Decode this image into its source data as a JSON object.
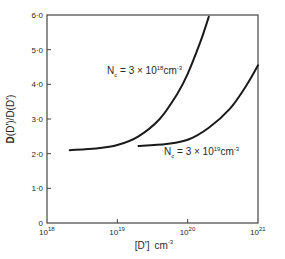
{
  "chart_data": {
    "type": "line",
    "title": "",
    "xlabel": "[D'] cm^-3",
    "xlabel_parts": {
      "main": "[D']",
      "unit": "cm",
      "unit_exp": "-3"
    },
    "ylabel": "D(D')/D(D')",
    "ylabel_parts": {
      "bold": "D",
      "rest": "(D')/D(D')"
    },
    "xscale": "log",
    "xlim": [
      1e+18,
      1e+21
    ],
    "ylim": [
      0,
      6.0
    ],
    "grid": false,
    "legend": "none (curves labeled inline)",
    "x_ticks": [
      {
        "base": "10",
        "exp": "18",
        "value": 1e+18
      },
      {
        "base": "10",
        "exp": "19",
        "value": 1e+19
      },
      {
        "base": "10",
        "exp": "20",
        "value": 1e+20
      },
      {
        "base": "10",
        "exp": "21",
        "value": 1e+21
      }
    ],
    "y_ticks": [
      {
        "label": "0",
        "value": 0
      },
      {
        "label": "1·0",
        "value": 1.0
      },
      {
        "label": "2·0",
        "value": 2.0
      },
      {
        "label": "3·0",
        "value": 3.0
      },
      {
        "label": "4·0",
        "value": 4.0
      },
      {
        "label": "5·0",
        "value": 5.0
      },
      {
        "label": "6·0",
        "value": 6.0
      }
    ],
    "series": [
      {
        "name": "Nc = 3×10^18 cm^-3",
        "label_parts": {
          "pre": "N",
          "sub": "c",
          "mid": " = 3 × 10",
          "exp": "18",
          "unit": "cm",
          "unit_exp": "-3"
        },
        "x": [
          2.1e+18,
          5e+18,
          1e+19,
          2e+19,
          4e+19,
          7e+19,
          1e+20,
          1.5e+20,
          2e+20
        ],
        "values": [
          2.1,
          2.15,
          2.25,
          2.5,
          3.0,
          3.7,
          4.3,
          5.2,
          5.95
        ]
      },
      {
        "name": "Nc = 3×10^19 cm^-3",
        "label_parts": {
          "pre": "N",
          "sub": "c",
          "mid": " = 3 × 10",
          "exp": "19",
          "unit": "cm",
          "unit_exp": "-3"
        },
        "x": [
          2e+19,
          5e+19,
          1e+20,
          2e+20,
          4e+20,
          7e+20,
          1e+21
        ],
        "values": [
          2.22,
          2.28,
          2.4,
          2.75,
          3.3,
          4.0,
          4.55
        ]
      }
    ]
  }
}
